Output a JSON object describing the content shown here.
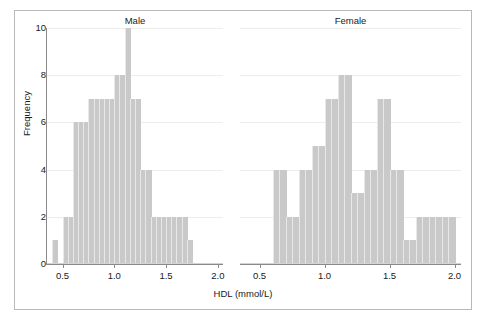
{
  "chart_data": {
    "type": "bar",
    "chart_kind": "histogram",
    "title": "",
    "xlabel": "HDL (mmol/L)",
    "ylabel": "Frequency",
    "xlim": [
      0.35,
      2.05
    ],
    "ylim": [
      0,
      10
    ],
    "bin_width": 0.05,
    "grid": true,
    "grid_axis": "y",
    "legend": "none",
    "bar_color": "#c9c9c9",
    "axis_color": "#8a8a8a",
    "grid_color": "#ededed",
    "frame_color": "#b9b9b9",
    "text_color": "#1a1a1a",
    "yticks": [
      0,
      2,
      4,
      6,
      8,
      10
    ],
    "ytick_labels": [
      "0",
      "2",
      "4",
      "6",
      "8",
      "10"
    ],
    "xticks": [
      0.5,
      1.0,
      1.5,
      2.0
    ],
    "xtick_labels": [
      "0.5",
      "1.0",
      "1.5",
      "2.0"
    ],
    "panels": [
      {
        "name": "male-panel",
        "strip_label": "Male",
        "bin_starts": [
          0.4,
          0.45,
          0.5,
          0.55,
          0.6,
          0.65,
          0.7,
          0.75,
          0.8,
          0.85,
          0.9,
          0.95,
          1.0,
          1.05,
          1.1,
          1.15,
          1.2,
          1.25,
          1.3,
          1.35,
          1.4,
          1.45,
          1.5,
          1.55,
          1.6,
          1.65,
          1.7
        ],
        "values": [
          1,
          0,
          2,
          2,
          6,
          6,
          6,
          7,
          7,
          7,
          7,
          7,
          8,
          8,
          10,
          7,
          7,
          4,
          4,
          2,
          2,
          2,
          2,
          2,
          2,
          2,
          1
        ]
      },
      {
        "name": "female-panel",
        "strip_label": "Female",
        "bin_starts": [
          0.6,
          0.65,
          0.7,
          0.75,
          0.8,
          0.85,
          0.9,
          0.95,
          1.0,
          1.05,
          1.1,
          1.15,
          1.2,
          1.25,
          1.3,
          1.35,
          1.4,
          1.45,
          1.5,
          1.55,
          1.6,
          1.65,
          1.7,
          1.75,
          1.8,
          1.85,
          1.9,
          1.95
        ],
        "values": [
          4,
          4,
          2,
          2,
          4,
          4,
          5,
          5,
          7,
          7,
          8,
          8,
          3,
          3,
          4,
          4,
          7,
          7,
          4,
          4,
          1,
          1,
          2,
          2,
          2,
          2,
          2,
          2
        ]
      }
    ]
  },
  "figure": {
    "ylabel": "Frequency",
    "xlabel": "HDL (mmol/L)",
    "panel_titles": [
      "Male",
      "Female"
    ]
  }
}
